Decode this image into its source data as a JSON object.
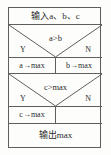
{
  "diagram": {
    "type": "nassi-shneiderman-flowchart",
    "title_text": "",
    "border_color": "#5e5e5e",
    "background_color": "#fdfdfb",
    "text_color": "#2b2b2b",
    "blocks": {
      "input": {
        "label": "输入a、b、c"
      },
      "selection_ab": {
        "condition": "a>b",
        "yes_label": "Y",
        "no_label": "N",
        "yes_branch": "a→max",
        "no_branch": "b→max"
      },
      "selection_cmax": {
        "condition": "c>max",
        "yes_label": "Y",
        "no_label": "N",
        "yes_branch": "c→max",
        "no_branch": ""
      },
      "output": {
        "label": "输出max"
      }
    }
  }
}
